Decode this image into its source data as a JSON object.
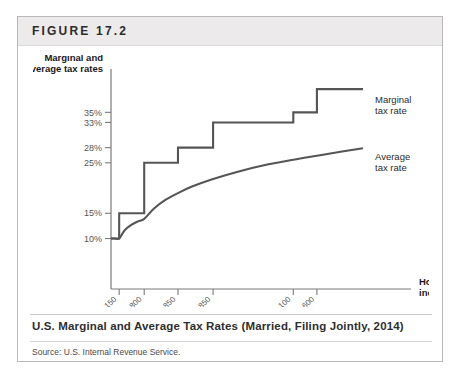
{
  "figure": {
    "label": "FIGURE 17.2",
    "caption": "U.S. Marginal and Average Tax Rates (Married, Filing Jointly, 2014)",
    "source": "Source: U.S. Internal Revenue Service."
  },
  "chart_data": {
    "type": "line",
    "title": "U.S. Marginal and Average Tax Rates (Married, Filing Jointly, 2014)",
    "xlabel": "Household income",
    "ylabel": "Marginal and average tax rates",
    "grid": false,
    "legend_position": "right-inline-annotations",
    "ylim": [
      0,
      42
    ],
    "ytick_labels": [
      "35%",
      "33%",
      "28%",
      "25%",
      "15%",
      "10%"
    ],
    "ytick_values": [
      35,
      33,
      28,
      25,
      15,
      10
    ],
    "xtick_labels": [
      "$18,150",
      "$73,800",
      "$148,850",
      "$226,850",
      "$405,100",
      "$457,600"
    ],
    "xtick_values": [
      18150,
      73800,
      148850,
      226850,
      405100,
      457600
    ],
    "xlim": [
      0,
      560000
    ],
    "series": [
      {
        "name": "Marginal tax rate",
        "style": "step",
        "annotation": [
          "Marginal",
          "tax rate"
        ],
        "brackets": [
          {
            "lower": 0,
            "upper": 18150,
            "rate": 10
          },
          {
            "lower": 18150,
            "upper": 73800,
            "rate": 15
          },
          {
            "lower": 73800,
            "upper": 148850,
            "rate": 25
          },
          {
            "lower": 148850,
            "upper": 226850,
            "rate": 28
          },
          {
            "lower": 226850,
            "upper": 405100,
            "rate": 33
          },
          {
            "lower": 405100,
            "upper": 457600,
            "rate": 35
          },
          {
            "lower": 457600,
            "upper": 560000,
            "rate": 39.6
          }
        ]
      },
      {
        "name": "Average tax rate",
        "style": "smooth",
        "annotation": [
          "Average",
          "tax rate"
        ],
        "points": [
          {
            "x": 0,
            "y": 10.0
          },
          {
            "x": 9000,
            "y": 10.0
          },
          {
            "x": 18150,
            "y": 10.0
          },
          {
            "x": 30000,
            "y": 11.6
          },
          {
            "x": 45000,
            "y": 12.7
          },
          {
            "x": 60000,
            "y": 13.4
          },
          {
            "x": 73800,
            "y": 13.9
          },
          {
            "x": 95000,
            "y": 15.9
          },
          {
            "x": 120000,
            "y": 17.6
          },
          {
            "x": 148850,
            "y": 19.0
          },
          {
            "x": 180000,
            "y": 20.3
          },
          {
            "x": 226850,
            "y": 21.8
          },
          {
            "x": 280000,
            "y": 23.2
          },
          {
            "x": 340000,
            "y": 24.5
          },
          {
            "x": 405100,
            "y": 25.6
          },
          {
            "x": 457600,
            "y": 26.4
          },
          {
            "x": 510000,
            "y": 27.2
          },
          {
            "x": 560000,
            "y": 27.9
          }
        ]
      }
    ]
  }
}
